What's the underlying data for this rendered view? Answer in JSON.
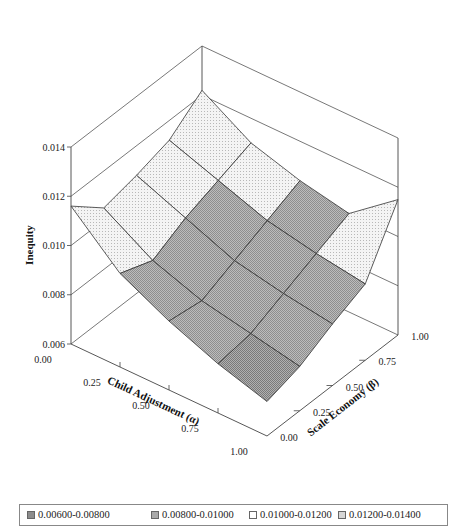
{
  "chart_data": {
    "type": "surface3d",
    "title": "",
    "xlabel": "Child Adjustment (α)",
    "ylabel": "Scale Economy (β)",
    "zlabel": "Inequity",
    "x_ticks": [
      "0.00",
      "0.25",
      "0.50",
      "0.75",
      "1.00"
    ],
    "y_ticks": [
      "0.00",
      "0.25",
      "0.50",
      "0.75",
      "1.00"
    ],
    "z_ticks": [
      "0.006",
      "0.008",
      "0.010",
      "0.012",
      "0.014"
    ],
    "zlim": [
      0.006,
      0.014
    ],
    "grid": true,
    "x": [
      0.0,
      0.25,
      0.5,
      0.75,
      1.0
    ],
    "y": [
      0.0,
      0.25,
      0.5,
      0.75,
      1.0
    ],
    "z": [
      [
        0.0116,
        0.0105,
        0.0108,
        0.0112,
        0.0122
      ],
      [
        0.0098,
        0.0093,
        0.01,
        0.0105,
        0.011
      ],
      [
        0.0088,
        0.0086,
        0.0092,
        0.0098,
        0.0104
      ],
      [
        0.008,
        0.0082,
        0.0088,
        0.0094,
        0.01
      ],
      [
        0.0074,
        0.0078,
        0.0085,
        0.0091,
        0.0115
      ]
    ],
    "legend": {
      "position": "bottom",
      "entries": [
        "0.00600-0.00800",
        "0.00800-0.01000",
        "0.01000-0.01200",
        "0.01200-0.01400"
      ]
    }
  },
  "legend": {
    "items": [
      {
        "label": "0.00600-0.00800",
        "color": "#8c8c8c"
      },
      {
        "label": "0.00800-0.01000",
        "color": "#a9a9a9"
      },
      {
        "label": "0.01000-0.01200",
        "color": "#ffffff"
      },
      {
        "label": "0.01200-0.01400",
        "color": "#d6d6d6"
      }
    ]
  },
  "axes": {
    "z_title": "Inequity",
    "x_title": "Child Adjustment (α)",
    "y_title": "Scale Economy (β)"
  }
}
